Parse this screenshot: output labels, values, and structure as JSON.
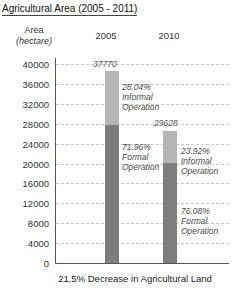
{
  "title": "Agricultural Area (2005 - 2011)",
  "yaxis": {
    "label_line1": "Area",
    "label_line2": "(hectare)",
    "min": 0,
    "max": 40000,
    "step": 4000
  },
  "chart_data": {
    "type": "bar",
    "stacked": true,
    "title": "Agricultural Area (2005 - 2011)",
    "categories": [
      "2005",
      "2010"
    ],
    "totals": [
      37770,
      29628
    ],
    "series": [
      {
        "name": "Formal Operation",
        "percent": [
          71.96,
          76.08
        ],
        "values": [
          27179,
          22541
        ],
        "color": "#7e7e7e"
      },
      {
        "name": "Informal Operation",
        "percent": [
          28.04,
          23.92
        ],
        "values": [
          10591,
          7087
        ],
        "color": "#b5b5b5"
      }
    ],
    "bar_value_labels": [
      "37770",
      "29628"
    ],
    "annotations": [
      "28.04%\nInformal\nOperation",
      "71.96%\nFormal\nOperation",
      "23.92%\nInformal\nOperation",
      "76.08%\nFormal\nOperation"
    ],
    "ylabel": "Area (hectare)",
    "ylim": [
      0,
      40000
    ],
    "ytick_step": 4000,
    "grid": "horizontal dashed",
    "legend": "inline annotations",
    "caption": "21.5% Decrease in Agricultural Land"
  },
  "colors": {
    "formal_bar": "#7e7e7e",
    "informal_bar": "#b5b5b5",
    "gridline": "#c6c6c6",
    "axis": "#555555",
    "text": "#222222"
  }
}
